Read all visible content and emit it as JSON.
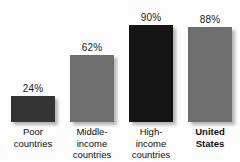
{
  "chart_data": {
    "type": "bar",
    "title": "",
    "subtitle": "",
    "xlabel": "",
    "ylabel": "",
    "ylim": [
      0,
      100
    ],
    "grid": false,
    "legend": "none",
    "categories": [
      "Poor countries",
      "Middle-income countries",
      "High-income countries",
      "United States"
    ],
    "category_lines": [
      [
        "Poor",
        "countries"
      ],
      [
        "Middle-",
        "income",
        "countries"
      ],
      [
        "High-",
        "income",
        "countries"
      ],
      [
        "United",
        "States"
      ]
    ],
    "values": [
      24,
      62,
      90,
      88
    ],
    "value_labels": [
      "24%",
      "62%",
      "90%",
      "88%"
    ],
    "bar_colors": [
      "#343434",
      "#6e6e6e",
      "#141414",
      "#6e6e6e"
    ],
    "emphasis_index": 3,
    "background": "#fdfdfd",
    "text_color": "#101010"
  },
  "bars": [
    {
      "value_label": "24%",
      "lines": {
        "l0": "Poor",
        "l1": "countries",
        "l2": ""
      }
    },
    {
      "value_label": "62%",
      "lines": {
        "l0": "Middle-",
        "l1": "income",
        "l2": "countries"
      }
    },
    {
      "value_label": "90%",
      "lines": {
        "l0": "High-",
        "l1": "income",
        "l2": "countries"
      }
    },
    {
      "value_label": "88%",
      "lines": {
        "l0": "United",
        "l1": "States",
        "l2": ""
      }
    }
  ]
}
